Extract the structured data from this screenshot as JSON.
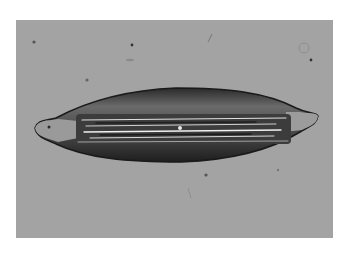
{
  "image": {
    "kind": "brightfield micrograph",
    "subject": "elongated spindle-shaped crystal",
    "background_color": "#a3a3a3",
    "page_color": "#ffffff"
  }
}
